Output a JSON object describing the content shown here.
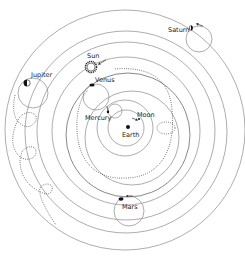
{
  "diagram": {
    "type": "geocentric-planetary-model",
    "labels": {
      "earth": "Earth",
      "moon": "Moon",
      "mercury": "Mercury",
      "venus": "Venus",
      "sun": "Sun",
      "mars": "Mars",
      "jupiter": "Jupiter",
      "saturn": "Saturn"
    },
    "colors": {
      "orbit_line": "#8a8a8a",
      "path_dotted": "#333333",
      "planet": "#111111",
      "background": "#ffffff"
    }
  }
}
